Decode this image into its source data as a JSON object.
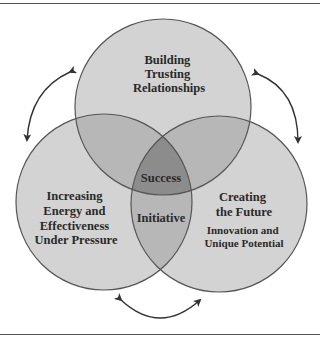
{
  "diagram": {
    "type": "venn",
    "circles": [
      {
        "id": "top",
        "lines": [
          "Building",
          "Trusting",
          "Relationships"
        ]
      },
      {
        "id": "left",
        "lines": [
          "Increasing",
          "Energy and",
          "Effectiveness",
          "Under Pressure"
        ]
      },
      {
        "id": "right",
        "lines": [
          "Creating",
          "the Future"
        ],
        "sub_lines": [
          "Innovation and",
          "Unique Potential"
        ]
      }
    ],
    "center_label": "Success",
    "bottom_overlap_label": "Initiative",
    "arrows": [
      "left-cycle-arrow",
      "right-cycle-arrow",
      "bottom-cycle-arrow"
    ],
    "colors": {
      "single": "#d3d3d3",
      "double": "#b7b7b7",
      "triple": "#8c8c8c",
      "outline": "#555555",
      "text": "#2a2a2a"
    }
  }
}
